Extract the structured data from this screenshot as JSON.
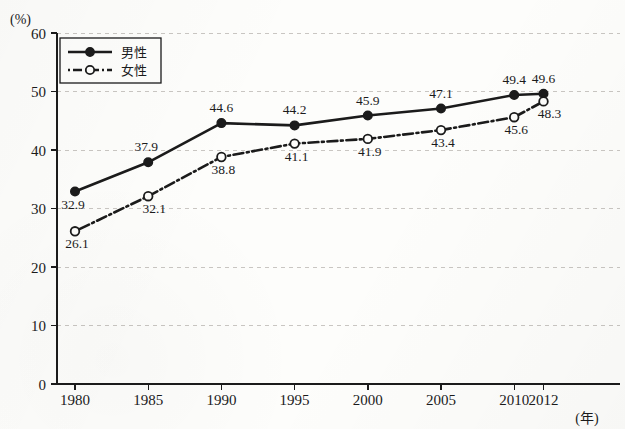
{
  "figure": {
    "y_axis_unit": "(%)",
    "x_axis_unit": "(年)"
  },
  "legend": {
    "items": [
      {
        "label": "男性",
        "style": "solid-filled-circle"
      },
      {
        "label": "女性",
        "style": "dashdot-open-circle"
      }
    ]
  },
  "chart_data": {
    "type": "line",
    "title": "",
    "subtitle": "",
    "xlabel": "(年)",
    "ylabel": "(%)",
    "ylim": [
      0,
      60
    ],
    "ytick_labels": [
      "0",
      "10",
      "20",
      "30",
      "40",
      "50",
      "60"
    ],
    "yticks": [
      0,
      10,
      20,
      30,
      40,
      50,
      60
    ],
    "grid": true,
    "grid_axis": "y",
    "legend_position": "upper-left-inside",
    "categories": [
      "1980",
      "1985",
      "1990",
      "1995",
      "2000",
      "2005",
      "2010",
      "2012"
    ],
    "x": [
      1980,
      1985,
      1990,
      1995,
      2000,
      2005,
      2010,
      2012
    ],
    "series": [
      {
        "name": "男性",
        "marker": "filled-circle",
        "line": "solid",
        "values": [
          32.9,
          37.9,
          44.6,
          44.2,
          45.9,
          47.1,
          49.4,
          49.6
        ],
        "labels": [
          "32.9",
          "37.9",
          "44.6",
          "44.2",
          "45.9",
          "47.1",
          "49.4",
          "49.6"
        ]
      },
      {
        "name": "女性",
        "marker": "open-circle",
        "line": "dashdot",
        "values": [
          26.1,
          32.1,
          38.8,
          41.1,
          41.9,
          43.4,
          45.6,
          48.3
        ],
        "labels": [
          "26.1",
          "32.1",
          "38.8",
          "41.1",
          "41.9",
          "43.4",
          "45.6",
          "48.3"
        ]
      }
    ]
  },
  "colors": {
    "ink": "#1b1b1b",
    "grid": "#c9c6c2",
    "paper": "#fdfdfb"
  }
}
